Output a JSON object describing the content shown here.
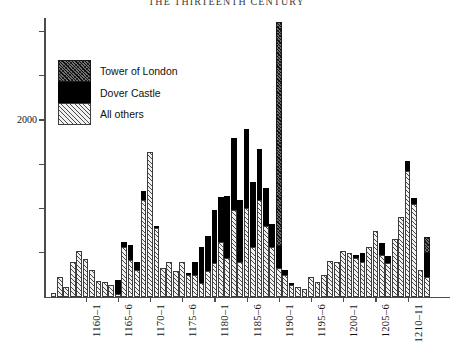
{
  "title": "THE THIRTEENTH CENTURY",
  "legend": {
    "items": [
      {
        "label": "Tower of London",
        "pattern": "tower",
        "color": "#6f6f6f"
      },
      {
        "label": "Dover Castle",
        "pattern": "dover",
        "color": "#000000"
      },
      {
        "label": "All others",
        "pattern": "other",
        "color": "#f2f2f2"
      }
    ]
  },
  "yaxis": {
    "labels": [
      {
        "value": 2000,
        "text": "2000"
      }
    ],
    "ticks": [
      500,
      1000,
      1500,
      2000,
      2500,
      3000
    ],
    "range": [
      0,
      3150
    ]
  },
  "xaxis": {
    "tick_labels": [
      "1160–1",
      "1165–6",
      "1170–1",
      "1175–6",
      "1180–1",
      "1185–6",
      "1190–1",
      "1195–6",
      "1200–1",
      "1205–6",
      "1210–11"
    ],
    "tick_years": [
      1160,
      1165,
      1170,
      1175,
      1180,
      1185,
      1190,
      1195,
      1200,
      1205,
      1210
    ]
  },
  "chart_data": {
    "type": "bar",
    "subtype": "stacked",
    "title": "THE THIRTEENTH CENTURY",
    "xlabel": "",
    "ylabel": "",
    "ylim": [
      0,
      3150
    ],
    "ytick_values": [
      500,
      1000,
      1500,
      2000,
      2500,
      3000
    ],
    "ytick_labels_shown": [
      "2000"
    ],
    "grid": false,
    "legend_position": "upper-left-inside",
    "x": [
      1155,
      1156,
      1157,
      1158,
      1159,
      1160,
      1161,
      1162,
      1163,
      1164,
      1165,
      1166,
      1167,
      1168,
      1169,
      1170,
      1171,
      1172,
      1173,
      1174,
      1175,
      1176,
      1177,
      1178,
      1179,
      1180,
      1181,
      1182,
      1183,
      1184,
      1185,
      1186,
      1187,
      1188,
      1189,
      1190,
      1191,
      1192,
      1193,
      1194,
      1195,
      1196,
      1197,
      1198,
      1199,
      1200,
      1201,
      1202,
      1203,
      1204,
      1205,
      1206,
      1207,
      1208,
      1209,
      1210,
      1211,
      1212,
      1213
    ],
    "categories": [
      "1155",
      "1156",
      "1157",
      "1158",
      "1159",
      "1160",
      "1161",
      "1162",
      "1163",
      "1164",
      "1165",
      "1166",
      "1167",
      "1168",
      "1169",
      "1170",
      "1171",
      "1172",
      "1173",
      "1174",
      "1175",
      "1176",
      "1177",
      "1178",
      "1179",
      "1180",
      "1181",
      "1182",
      "1183",
      "1184",
      "1185",
      "1186",
      "1187",
      "1188",
      "1189",
      "1190",
      "1191",
      "1192",
      "1193",
      "1194",
      "1195",
      "1196",
      "1197",
      "1198",
      "1199",
      "1200",
      "1201",
      "1202",
      "1203",
      "1204",
      "1205",
      "1206",
      "1207",
      "1208",
      "1209",
      "1210",
      "1211",
      "1212",
      "1213"
    ],
    "series": [
      {
        "name": "All others",
        "pattern": "other",
        "values": [
          40,
          230,
          110,
          400,
          520,
          430,
          310,
          180,
          170,
          130,
          30,
          560,
          420,
          300,
          1090,
          1640,
          780,
          330,
          400,
          290,
          390,
          250,
          250,
          160,
          290,
          380,
          620,
          440,
          980,
          400,
          1000,
          560,
          1100,
          800,
          560,
          330,
          250,
          140,
          110,
          90,
          230,
          170,
          250,
          410,
          390,
          520,
          500,
          440,
          390,
          560,
          740,
          470,
          380,
          650,
          900,
          1420,
          1050,
          300,
          230
        ]
      },
      {
        "name": "Dover Castle",
        "pattern": "dover",
        "values": [
          0,
          0,
          0,
          0,
          0,
          0,
          0,
          0,
          0,
          0,
          160,
          60,
          170,
          100,
          110,
          0,
          20,
          0,
          0,
          0,
          0,
          20,
          140,
          410,
          400,
          600,
          510,
          700,
          820,
          700,
          900,
          740,
          570,
          430,
          260,
          250,
          60,
          20,
          0,
          0,
          0,
          0,
          0,
          0,
          0,
          0,
          0,
          30,
          110,
          0,
          0,
          140,
          80,
          0,
          0,
          120,
          70,
          0,
          270
        ]
      },
      {
        "name": "Tower of London",
        "pattern": "tower",
        "values": [
          0,
          0,
          0,
          0,
          0,
          0,
          0,
          0,
          0,
          0,
          0,
          0,
          0,
          0,
          0,
          0,
          0,
          0,
          0,
          0,
          0,
          0,
          0,
          0,
          0,
          0,
          0,
          0,
          0,
          0,
          0,
          0,
          0,
          0,
          0,
          2530,
          0,
          0,
          0,
          0,
          0,
          0,
          0,
          0,
          0,
          0,
          0,
          0,
          0,
          0,
          0,
          0,
          0,
          0,
          0,
          0,
          0,
          0,
          180
        ]
      }
    ],
    "annotations": [
      {
        "text": "Tall 1190 spike dominated by Tower of London expenditure",
        "year": 1190
      }
    ]
  }
}
